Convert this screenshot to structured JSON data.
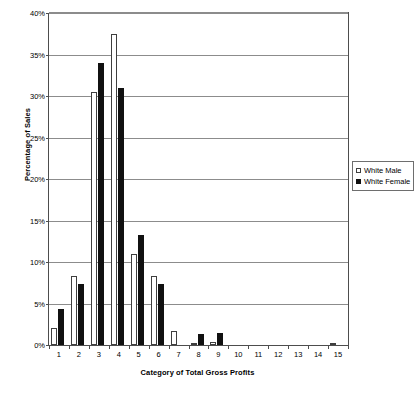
{
  "chart_data": {
    "type": "bar",
    "title": "",
    "xlabel": "Category of Total Gross Profits",
    "ylabel": "Percentage of Sales",
    "categories": [
      "1",
      "2",
      "3",
      "4",
      "5",
      "6",
      "7",
      "8",
      "9",
      "10",
      "11",
      "12",
      "13",
      "14",
      "15"
    ],
    "series": [
      {
        "name": "White Male",
        "color": "#ffffff",
        "values": [
          2.0,
          8.3,
          30.5,
          37.5,
          11.0,
          8.3,
          1.7,
          0.3,
          0.4,
          0,
          0,
          0,
          0,
          0,
          0.3
        ]
      },
      {
        "name": "White Female",
        "color": "#111111",
        "values": [
          4.3,
          7.3,
          34.0,
          31.0,
          13.3,
          7.3,
          0,
          1.3,
          1.4,
          0,
          0,
          0,
          0,
          0,
          0
        ]
      }
    ],
    "ylim": [
      0,
      40
    ],
    "ytick_values": [
      0,
      5,
      10,
      15,
      20,
      25,
      30,
      35,
      40
    ],
    "ytick_labels": [
      "0%",
      "5%",
      "10%",
      "15%",
      "20%",
      "25%",
      "30%",
      "35%",
      "40%"
    ],
    "grid": "horizontal",
    "legend_position": "right-middle"
  },
  "legend": {
    "entries": [
      {
        "label": "White Male",
        "swatch": "open-square"
      },
      {
        "label": "White Female",
        "swatch": "filled-square"
      }
    ]
  },
  "caption": {
    "fragment": ""
  }
}
